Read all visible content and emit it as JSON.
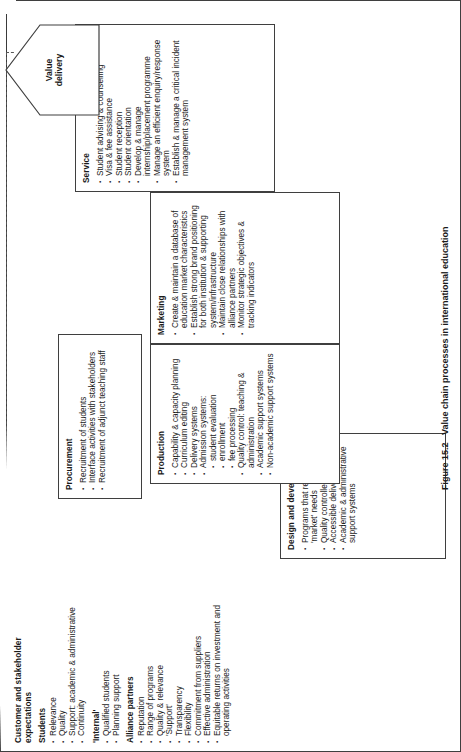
{
  "figure": {
    "number": "Figure 15.2",
    "caption": "Value chain processes in international education"
  },
  "logistics": {
    "title": "Logistics",
    "items": [
      "Information stocks & flows",
      "Educational materials management",
      "Student movement and accommodation",
      "Promotional materials",
      "Visiting delegations; movement and accommodation"
    ]
  },
  "customer": {
    "title": "Customer and stakeholder expectations",
    "groups": [
      {
        "heading": "Students",
        "items": [
          "Relevance",
          "Quality",
          "Support: academic & administrative",
          "Continuity"
        ]
      },
      {
        "heading": "'Internal'",
        "items": [
          "Qualified students",
          "Planning support"
        ]
      },
      {
        "heading": "Alliance partners",
        "items": [
          "Reputation",
          "Range of programs",
          "Quality & relevance",
          "'Support'",
          "Transparency",
          "Flexibility",
          "Commitment from suppliers",
          "Effective administration",
          "Equitable returns on investment and operating activities"
        ]
      }
    ]
  },
  "design": {
    "title": "Design and development",
    "items": [
      "Programs that reflect 'market' needs",
      "Quality controlled content",
      "Accessible delivery media",
      "Academic & administrative support systems"
    ]
  },
  "procurement": {
    "title": "Procurement",
    "items": [
      "Recruitment of students",
      "Interface activities with stakeholders",
      "Recruitment of adjunct teaching staff"
    ]
  },
  "production": {
    "title": "Production",
    "items": [
      {
        "text": "Capability & capacity planning",
        "level": 1
      },
      {
        "text": "Curriculum editing",
        "level": 1
      },
      {
        "text": "Delivery systems",
        "level": 1
      },
      {
        "text": "Admission systems:",
        "level": 1
      },
      {
        "text": "student evaluation",
        "level": 2
      },
      {
        "text": "enrollment",
        "level": 2
      },
      {
        "text": "fee processing",
        "level": 2
      },
      {
        "text": "Quality control: teaching & administration",
        "level": 1
      },
      {
        "text": "Academic support systems",
        "level": 1
      },
      {
        "text": "Non-academic support systems",
        "level": 1
      }
    ]
  },
  "marketing": {
    "title": "Marketing",
    "items": [
      "Create & maintain a database of education market characteristics",
      "Establish strong brand positioning for both institution & supporting system/infrastructure",
      "Maintain close relationships with alliance partners",
      "Monitor strategic objectives & tracking indicators"
    ]
  },
  "service": {
    "title": "Service",
    "items": [
      "Student advising & counselling",
      "Visa & fee assistance",
      "Student reception",
      "Student orientation",
      "Develop & manage internship/placement programme",
      "Manage an efficient enquiry/response system",
      "Establish & manage a critical incident management system"
    ]
  },
  "value_delivery": {
    "label": "Value delivery"
  },
  "colors": {
    "stroke": "#3f3f3f",
    "text": "#1a1a1a",
    "background": "#ffffff"
  }
}
